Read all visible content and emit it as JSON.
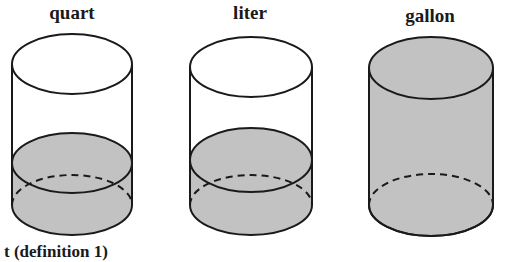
{
  "labels": {
    "quart": "quart",
    "liter": "liter",
    "gallon": "gallon"
  },
  "caption": "t (definition 1)",
  "colors": {
    "fill": "#c2c2c2",
    "stroke": "#1a1a1a",
    "background": "#ffffff"
  },
  "containers": [
    {
      "name": "quart",
      "fill_level": "about one quarter full"
    },
    {
      "name": "liter",
      "fill_level": "about one quarter full (slightly more than quart)"
    },
    {
      "name": "gallon",
      "fill_level": "full"
    }
  ]
}
